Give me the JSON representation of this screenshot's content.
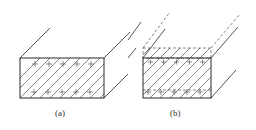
{
  "figure": {
    "panels": [
      {
        "id": "a",
        "label": "(a)",
        "description": "Conductor cross-section with uniform charge across full rectangle"
      },
      {
        "id": "b",
        "label": "(b)",
        "description": "Conductor cross-section with dashed extended region above"
      }
    ],
    "colors": {
      "line": "#2a2a2a",
      "hatch": "#555555",
      "background": "#ffffff"
    }
  }
}
